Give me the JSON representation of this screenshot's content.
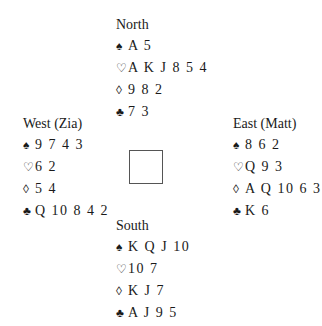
{
  "hands": {
    "north": {
      "name": "North",
      "spades": "A 5",
      "hearts": "A K J 8 5 4",
      "diamonds": "9 8 2",
      "clubs": "7 3"
    },
    "west": {
      "name": "West (Zia)",
      "spades": "9 7 4 3",
      "hearts": "6 2",
      "diamonds": "5 4",
      "clubs": "Q 10 8 4 2"
    },
    "east": {
      "name": "East (Matt)",
      "spades": "8 6 2",
      "hearts": "Q 9 3",
      "diamonds": "A Q 10 6 3",
      "clubs": "K 6"
    },
    "south": {
      "name": "South",
      "spades": "K Q J 10",
      "hearts": "10 7",
      "diamonds": "K J 7",
      "clubs": "A J 9 5"
    }
  },
  "icons": {
    "spade": "♠",
    "heart": "♡",
    "diamond": "◊",
    "club": "♣"
  }
}
